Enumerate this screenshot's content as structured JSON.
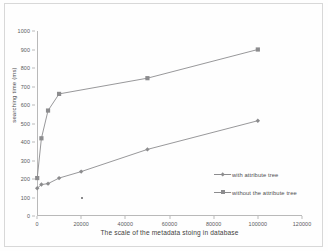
{
  "chart_data": {
    "type": "line",
    "title": "",
    "xlabel": "The scale of the metadata stoing in database",
    "ylabel": "searching time (ms)",
    "xlim": [
      0,
      120000
    ],
    "ylim": [
      0,
      1000
    ],
    "xticks": [
      0,
      20000,
      40000,
      60000,
      80000,
      100000,
      120000
    ],
    "yticks": [
      0,
      100,
      200,
      300,
      400,
      500,
      600,
      700,
      800,
      900,
      1000
    ],
    "grid": false,
    "legend_position": "right-inside-lower",
    "series": [
      {
        "name": "with attribute tree",
        "marker": "diamond",
        "color": "#8c8c8e",
        "x": [
          100,
          2000,
          5000,
          10000,
          20000,
          50000,
          100000
        ],
        "values": [
          150,
          170,
          175,
          205,
          240,
          360,
          515
        ]
      },
      {
        "name": "without the attribute tree",
        "marker": "square",
        "color": "#8c8c8e",
        "x": [
          100,
          2000,
          5000,
          10000,
          50000,
          100000
        ],
        "values": [
          205,
          420,
          570,
          660,
          745,
          900
        ]
      }
    ]
  },
  "axes": {
    "y_title": "searching time (ms)",
    "x_title": "The scale of the metadata stoing in database",
    "y_tick_labels": [
      "1000",
      "900",
      "800",
      "700",
      "600",
      "500",
      "400",
      "300",
      "200",
      "100",
      "0"
    ],
    "x_tick_labels": [
      "0",
      "20000",
      "40000",
      "60000",
      "80000",
      "100000",
      "120000"
    ]
  },
  "legend": {
    "entries": [
      {
        "label": "with attribute tree",
        "marker": "diamond"
      },
      {
        "label": "without the attribute tree",
        "marker": "square"
      }
    ]
  },
  "colors": {
    "series": "#8c8c8e",
    "axis": "#b9b9b9",
    "tick_text": "#59595b",
    "title_text": "#3f3f41",
    "frame": "#d8d8d8",
    "background": "#fefefe"
  }
}
